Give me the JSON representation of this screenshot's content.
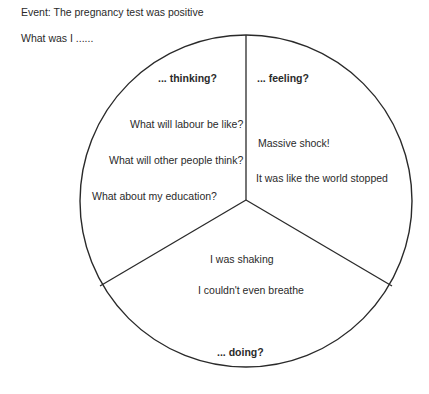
{
  "header": {
    "event": "Event: The pregnancy test was positive",
    "prompt": "What was I ......"
  },
  "diagram": {
    "type": "pie-reflection",
    "sections": {
      "thinking": {
        "title": "... thinking?",
        "items": [
          "What will labour be like?",
          "What will other people think?",
          "What about my education?"
        ]
      },
      "feeling": {
        "title": "... feeling?",
        "items": [
          "Massive shock!",
          "It was like the world stopped"
        ]
      },
      "doing": {
        "title": "... doing?",
        "items": [
          "I was shaking",
          "I couldn't even breathe"
        ]
      }
    }
  }
}
